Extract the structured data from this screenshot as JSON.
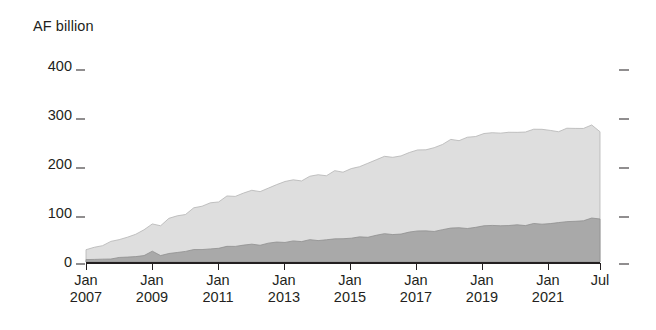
{
  "chart_data": {
    "type": "area",
    "stacked": true,
    "title": "",
    "ylabel": "AF billion",
    "xlabel": "",
    "ylim": [
      0,
      400
    ],
    "yticks": [
      0,
      100,
      200,
      300,
      400
    ],
    "ytick_labels": [
      "0",
      "100",
      "200",
      "300",
      "400"
    ],
    "grid": false,
    "legend": "none",
    "right_axis_ticks": [
      0,
      100,
      200,
      300,
      400
    ],
    "xtick_labels": [
      {
        "month": "Jan",
        "year": "2007"
      },
      {
        "month": "Jan",
        "year": "2009"
      },
      {
        "month": "Jan",
        "year": "2011"
      },
      {
        "month": "Jan",
        "year": "2013"
      },
      {
        "month": "Jan",
        "year": "2015"
      },
      {
        "month": "Jan",
        "year": "2017"
      },
      {
        "month": "Jan",
        "year": "2019"
      },
      {
        "month": "Jan",
        "year": "2021"
      },
      {
        "month": "Jul",
        "year": ""
      }
    ],
    "x_start": "Jan 2007",
    "x_end": "Jul 2022",
    "x": [
      "2007-01",
      "2007-04",
      "2007-07",
      "2007-10",
      "2008-01",
      "2008-04",
      "2008-07",
      "2008-10",
      "2009-01",
      "2009-04",
      "2009-07",
      "2009-10",
      "2010-01",
      "2010-04",
      "2010-07",
      "2010-10",
      "2011-01",
      "2011-04",
      "2011-07",
      "2011-10",
      "2012-01",
      "2012-04",
      "2012-07",
      "2012-10",
      "2013-01",
      "2013-04",
      "2013-07",
      "2013-10",
      "2014-01",
      "2014-04",
      "2014-07",
      "2014-10",
      "2015-01",
      "2015-04",
      "2015-07",
      "2015-10",
      "2016-01",
      "2016-04",
      "2016-07",
      "2016-10",
      "2017-01",
      "2017-04",
      "2017-07",
      "2017-10",
      "2018-01",
      "2018-04",
      "2018-07",
      "2018-10",
      "2019-01",
      "2019-04",
      "2019-07",
      "2019-10",
      "2020-01",
      "2020-04",
      "2020-07",
      "2020-10",
      "2021-01",
      "2021-04",
      "2021-07",
      "2021-10",
      "2022-01",
      "2022-04",
      "2022-07"
    ],
    "series": [
      {
        "name": "lower-series",
        "color": "#a9a9a9",
        "values": [
          4,
          5,
          6,
          7,
          8,
          9,
          11,
          13,
          22,
          15,
          17,
          19,
          22,
          24,
          26,
          27,
          29,
          30,
          31,
          33,
          35,
          36,
          38,
          39,
          41,
          42,
          43,
          44,
          45,
          46,
          47,
          48,
          49,
          51,
          52,
          54,
          56,
          57,
          58,
          60,
          62,
          63,
          64,
          66,
          68,
          69,
          70,
          71,
          72,
          73,
          74,
          75,
          76,
          76,
          77,
          78,
          79,
          80,
          82,
          83,
          85,
          88,
          86
        ]
      },
      {
        "name": "upper-series",
        "color": "#dedede",
        "values": [
          24,
          26,
          29,
          32,
          36,
          40,
          45,
          52,
          55,
          62,
          68,
          72,
          78,
          83,
          87,
          90,
          95,
          99,
          102,
          106,
          110,
          113,
          116,
          118,
          121,
          124,
          127,
          129,
          132,
          135,
          138,
          140,
          143,
          146,
          149,
          152,
          155,
          158,
          160,
          163,
          166,
          169,
          171,
          174,
          177,
          180,
          182,
          184,
          186,
          188,
          190,
          191,
          192,
          192,
          191,
          190,
          189,
          188,
          187,
          186,
          185,
          190,
          180
        ]
      }
    ],
    "totals_note": "upper values are the increment stacked on top of lower-series"
  }
}
